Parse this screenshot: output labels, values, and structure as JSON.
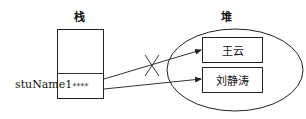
{
  "diagram": {
    "stack": {
      "title": "栈",
      "variable_label": "stuName1",
      "cell_value": "****"
    },
    "heap": {
      "title": "堆",
      "objects": [
        {
          "label": "王云"
        },
        {
          "label": "刘静涛"
        }
      ]
    },
    "references": [
      {
        "from": "stuName1",
        "to": "王云",
        "status": "removed",
        "marker": "cross"
      },
      {
        "from": "stuName1",
        "to": "刘静涛",
        "status": "active"
      }
    ],
    "colors": {
      "stroke": "#222222",
      "background": "#ffffff"
    }
  }
}
